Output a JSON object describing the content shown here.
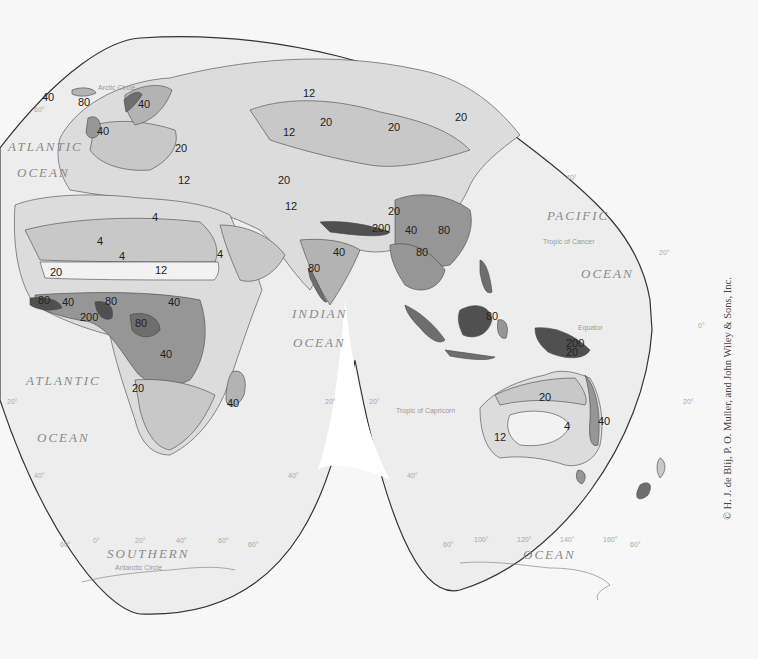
{
  "map": {
    "title": "World Precipitation (Eastern Hemisphere lobes)",
    "colors": {
      "paper": "#f7f7f7",
      "ocean": "#eeeeee",
      "outline": "#333333",
      "class_lt4": "#f2f2f2",
      "class_4_12": "#dcdcdc",
      "class_12_20": "#c8c8c8",
      "class_20_40": "#b3b3b3",
      "class_40_80": "#969696",
      "class_80_200": "#6e6e6e",
      "class_gt200": "#505050"
    },
    "ocean_labels": {
      "atlantic_n_1": "ATLANTIC",
      "atlantic_n_2": "OCEAN",
      "atlantic_s_1": "ATLANTIC",
      "atlantic_s_2": "OCEAN",
      "indian_1": "INDIAN",
      "indian_2": "OCEAN",
      "pacific_1": "PACIFIC",
      "pacific_2": "OCEAN",
      "southern_1": "SOUTHERN",
      "southern_2": "OCEAN"
    },
    "reference_lines": {
      "arctic_circle": "Arctic Circle",
      "tropic_cancer": "Tropic of Cancer",
      "equator": "Equator",
      "tropic_capricorn": "Tropic of Capricorn",
      "antarctic_circle": "Antarctic Circle"
    },
    "graticule": {
      "n60": "60°",
      "n40": "40°",
      "n20": "20°",
      "eq": "0°",
      "s20_w": "20°",
      "s20_mid_l": "20°",
      "s20_mid_r": "20°",
      "s20_e": "20°",
      "s40_w": "40°",
      "s40_mid_l": "40°",
      "s40_mid_r": "40°",
      "s60_a": "60°",
      "lon_0": "0°",
      "lon_20": "20°",
      "lon_40": "40°",
      "lon_60": "60°",
      "s60_b": "60°",
      "s60_c": "60°",
      "lon_100": "100°",
      "lon_120": "120°",
      "lon_140": "140°",
      "lon_160": "160°",
      "s60_d": "60°"
    },
    "isohyet_labels": [
      {
        "text": "40",
        "x": 42,
        "y": 101
      },
      {
        "text": "80",
        "x": 78,
        "y": 106
      },
      {
        "text": "40",
        "x": 138,
        "y": 108
      },
      {
        "text": "40",
        "x": 97,
        "y": 135
      },
      {
        "text": "20",
        "x": 175,
        "y": 152
      },
      {
        "text": "12",
        "x": 178,
        "y": 184
      },
      {
        "text": "12",
        "x": 303,
        "y": 97
      },
      {
        "text": "20",
        "x": 320,
        "y": 126
      },
      {
        "text": "20",
        "x": 388,
        "y": 131
      },
      {
        "text": "20",
        "x": 455,
        "y": 121
      },
      {
        "text": "12",
        "x": 283,
        "y": 136
      },
      {
        "text": "20",
        "x": 278,
        "y": 184
      },
      {
        "text": "12",
        "x": 285,
        "y": 210
      },
      {
        "text": "20",
        "x": 388,
        "y": 215
      },
      {
        "text": "200",
        "x": 372,
        "y": 232
      },
      {
        "text": "40",
        "x": 405,
        "y": 234
      },
      {
        "text": "80",
        "x": 438,
        "y": 234
      },
      {
        "text": "80",
        "x": 416,
        "y": 256
      },
      {
        "text": "40",
        "x": 333,
        "y": 256
      },
      {
        "text": "80",
        "x": 308,
        "y": 272
      },
      {
        "text": "4",
        "x": 97,
        "y": 245
      },
      {
        "text": "4",
        "x": 119,
        "y": 260
      },
      {
        "text": "4",
        "x": 152,
        "y": 221
      },
      {
        "text": "12",
        "x": 155,
        "y": 274
      },
      {
        "text": "4",
        "x": 217,
        "y": 258
      },
      {
        "text": "20",
        "x": 50,
        "y": 276
      },
      {
        "text": "80",
        "x": 38,
        "y": 304
      },
      {
        "text": "40",
        "x": 62,
        "y": 306
      },
      {
        "text": "80",
        "x": 105,
        "y": 305
      },
      {
        "text": "200",
        "x": 80,
        "y": 321
      },
      {
        "text": "80",
        "x": 135,
        "y": 327
      },
      {
        "text": "40",
        "x": 168,
        "y": 306
      },
      {
        "text": "40",
        "x": 160,
        "y": 358
      },
      {
        "text": "20",
        "x": 132,
        "y": 392
      },
      {
        "text": "40",
        "x": 227,
        "y": 407
      },
      {
        "text": "80",
        "x": 486,
        "y": 320
      },
      {
        "text": "200",
        "x": 566,
        "y": 347
      },
      {
        "text": "20",
        "x": 566,
        "y": 356
      },
      {
        "text": "20",
        "x": 539,
        "y": 401
      },
      {
        "text": "4",
        "x": 564,
        "y": 430
      },
      {
        "text": "12",
        "x": 494,
        "y": 441
      },
      {
        "text": "40",
        "x": 598,
        "y": 425
      }
    ],
    "credit": "© H. J. de Blij, P. O. Muller, and John Wiley & Sons, Inc."
  }
}
